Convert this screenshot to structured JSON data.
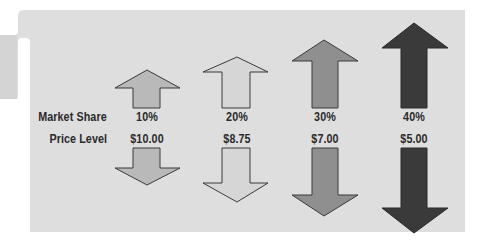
{
  "diagram": {
    "type": "paired-arrows",
    "background_color": "#dcdcdc",
    "rows": {
      "market_share_label": "Market Share",
      "price_level_label": "Price Level"
    },
    "columns": [
      {
        "market_share": "10%",
        "price_level": "$10.00",
        "up_fill": "#b9b9b9",
        "down_fill": "#b9b9b9"
      },
      {
        "market_share": "20%",
        "price_level": "$8.75",
        "up_fill": "#d6d6d6",
        "down_fill": "#d6d6d6"
      },
      {
        "market_share": "30%",
        "price_level": "$7.00",
        "up_fill": "#8f8f8f",
        "down_fill": "#8f8f8f"
      },
      {
        "market_share": "40%",
        "price_level": "$5.00",
        "up_fill": "#3a3a3a",
        "down_fill": "#3a3a3a"
      }
    ],
    "icons": {
      "up": "arrow-up-icon",
      "down": "arrow-down-icon"
    }
  }
}
